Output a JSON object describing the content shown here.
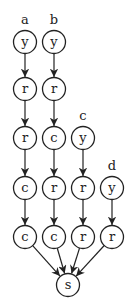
{
  "diagram": {
    "type": "directed-graph",
    "nodes": [
      {
        "id": "a1",
        "label": "y",
        "x": 25,
        "y": 42
      },
      {
        "id": "a2",
        "label": "r",
        "x": 25,
        "y": 89
      },
      {
        "id": "a3",
        "label": "r",
        "x": 25,
        "y": 138
      },
      {
        "id": "a4",
        "label": "c",
        "x": 25,
        "y": 188
      },
      {
        "id": "a5",
        "label": "c",
        "x": 25,
        "y": 237
      },
      {
        "id": "b1",
        "label": "y",
        "x": 54,
        "y": 42
      },
      {
        "id": "b2",
        "label": "r",
        "x": 54,
        "y": 89
      },
      {
        "id": "b3",
        "label": "c",
        "x": 54,
        "y": 138
      },
      {
        "id": "b4",
        "label": "r",
        "x": 54,
        "y": 188
      },
      {
        "id": "b5",
        "label": "c",
        "x": 54,
        "y": 237
      },
      {
        "id": "c1",
        "label": "y",
        "x": 83,
        "y": 138
      },
      {
        "id": "c2",
        "label": "r",
        "x": 83,
        "y": 188
      },
      {
        "id": "c3",
        "label": "r",
        "x": 83,
        "y": 237
      },
      {
        "id": "d1",
        "label": "y",
        "x": 112,
        "y": 188
      },
      {
        "id": "d2",
        "label": "r",
        "x": 112,
        "y": 237
      },
      {
        "id": "s",
        "label": "s",
        "x": 68,
        "y": 285
      }
    ],
    "column_labels": [
      {
        "text": "a",
        "x": 25,
        "y": 24
      },
      {
        "text": "b",
        "x": 54,
        "y": 24
      },
      {
        "text": "c",
        "x": 83,
        "y": 120
      },
      {
        "text": "d",
        "x": 112,
        "y": 170
      }
    ],
    "edges": [
      [
        "a1",
        "a2"
      ],
      [
        "a2",
        "a3"
      ],
      [
        "a3",
        "a4"
      ],
      [
        "a4",
        "a5"
      ],
      [
        "a5",
        "s"
      ],
      [
        "b1",
        "b2"
      ],
      [
        "b2",
        "b3"
      ],
      [
        "b3",
        "b4"
      ],
      [
        "b4",
        "b5"
      ],
      [
        "b5",
        "s"
      ],
      [
        "c1",
        "c2"
      ],
      [
        "c2",
        "c3"
      ],
      [
        "c3",
        "s"
      ],
      [
        "d1",
        "d2"
      ],
      [
        "d2",
        "s"
      ]
    ]
  }
}
